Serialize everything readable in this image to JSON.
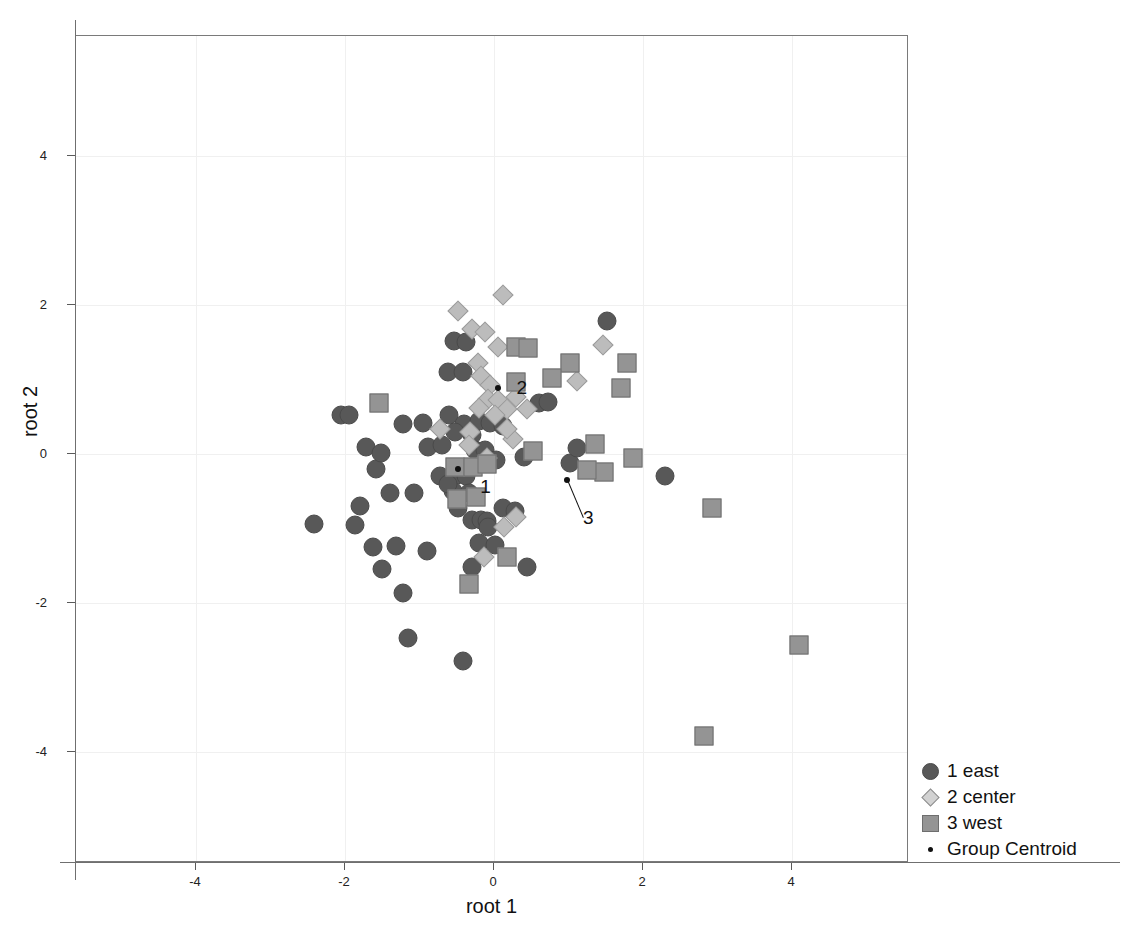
{
  "chart_data": {
    "type": "scatter",
    "title": "",
    "xlabel": "root 1",
    "ylabel": "root 2",
    "xlim": [
      -5.6,
      5.57
    ],
    "ylim": [
      -5.49,
      5.61
    ],
    "xticks": [
      -4,
      -2,
      0,
      2,
      4
    ],
    "yticks": [
      -4,
      -2,
      0,
      2,
      4
    ],
    "xticklabels": [
      "-4",
      "-2",
      "0",
      "2",
      "4"
    ],
    "yticklabels": [
      "-4",
      "-2",
      "0",
      "2",
      "4"
    ],
    "grid": true,
    "legend_position": "right-bottom-outside",
    "colors": {
      "group_1_east": "#585858",
      "group_2_center": "#bcbcbc",
      "group_3_west": "#949494",
      "centroid": "#111111",
      "gridline": "#f0f0f0",
      "frame": "#7a7a7a"
    },
    "series": [
      {
        "name": "1 east",
        "marker": "circle",
        "points": [
          [
            -2.42,
            -0.94
          ],
          [
            -2.05,
            0.53
          ],
          [
            -1.95,
            0.52
          ],
          [
            -1.72,
            0.09
          ],
          [
            -1.58,
            -0.2
          ],
          [
            -1.4,
            -0.52
          ],
          [
            -1.08,
            -0.52
          ],
          [
            -1.86,
            -0.95
          ],
          [
            -1.63,
            -1.25
          ],
          [
            -1.32,
            -1.24
          ],
          [
            -1.5,
            -1.55
          ],
          [
            -1.22,
            -1.87
          ],
          [
            -0.9,
            -1.3
          ],
          [
            -1.16,
            -2.47
          ],
          [
            -0.55,
            -0.5
          ],
          [
            -0.72,
            -0.3
          ],
          [
            -0.5,
            -0.28
          ],
          [
            -0.37,
            -0.3
          ],
          [
            -0.34,
            -0.52
          ],
          [
            -0.48,
            -0.72
          ],
          [
            -0.3,
            -0.88
          ],
          [
            -0.17,
            -0.88
          ],
          [
            -0.1,
            -0.9
          ],
          [
            -0.62,
            1.1
          ],
          [
            -0.42,
            1.1
          ],
          [
            -0.6,
            0.52
          ],
          [
            -0.4,
            0.4
          ],
          [
            -0.3,
            0.26
          ],
          [
            -0.25,
            0.05
          ],
          [
            -0.12,
            0.05
          ],
          [
            -0.06,
            -0.08
          ],
          [
            0.03,
            -0.08
          ],
          [
            -0.2,
            0.44
          ],
          [
            -0.05,
            0.42
          ],
          [
            0.12,
            0.38
          ],
          [
            -0.54,
            1.52
          ],
          [
            -0.38,
            1.5
          ],
          [
            -0.2,
            -1.2
          ],
          [
            0.02,
            -1.22
          ],
          [
            -0.3,
            -1.52
          ],
          [
            0.12,
            -0.72
          ],
          [
            0.28,
            -0.76
          ],
          [
            0.4,
            -0.04
          ],
          [
            0.6,
            0.68
          ],
          [
            0.72,
            0.7
          ],
          [
            1.02,
            -0.12
          ],
          [
            1.12,
            0.08
          ],
          [
            1.52,
            1.78
          ],
          [
            2.3,
            -0.3
          ],
          [
            0.44,
            -1.52
          ],
          [
            -0.42,
            -2.78
          ],
          [
            -0.08,
            -0.98
          ],
          [
            -0.62,
            -0.4
          ],
          [
            -1.22,
            0.4
          ],
          [
            -0.95,
            0.42
          ],
          [
            -1.52,
            0.02
          ],
          [
            -1.8,
            -0.7
          ],
          [
            -0.88,
            0.1
          ],
          [
            -0.7,
            0.12
          ],
          [
            -0.52,
            0.3
          ]
        ]
      },
      {
        "name": "2 center",
        "marker": "diamond",
        "points": [
          [
            -0.48,
            1.92
          ],
          [
            0.12,
            2.14
          ],
          [
            -0.3,
            1.68
          ],
          [
            -0.12,
            1.64
          ],
          [
            0.06,
            1.44
          ],
          [
            -0.22,
            1.22
          ],
          [
            -0.18,
            1.05
          ],
          [
            -0.05,
            0.92
          ],
          [
            -0.08,
            0.74
          ],
          [
            0.05,
            0.72
          ],
          [
            0.18,
            0.6
          ],
          [
            -0.2,
            0.62
          ],
          [
            -0.32,
            0.3
          ],
          [
            0.02,
            0.52
          ],
          [
            -0.34,
            0.12
          ],
          [
            -0.1,
            -0.06
          ],
          [
            0.26,
            0.2
          ],
          [
            0.18,
            0.34
          ],
          [
            0.3,
            -0.84
          ],
          [
            0.14,
            -0.98
          ],
          [
            -0.14,
            -1.38
          ],
          [
            1.46,
            1.46
          ],
          [
            1.12,
            0.98
          ],
          [
            -0.72,
            0.34
          ],
          [
            0.44,
            0.6
          ],
          [
            0.3,
            0.76
          ]
        ]
      },
      {
        "name": "3 west",
        "marker": "square",
        "points": [
          [
            -1.55,
            0.68
          ],
          [
            0.3,
            1.44
          ],
          [
            0.45,
            1.42
          ],
          [
            1.02,
            1.22
          ],
          [
            1.78,
            1.22
          ],
          [
            1.7,
            0.88
          ],
          [
            0.3,
            0.96
          ],
          [
            0.52,
            0.04
          ],
          [
            -0.52,
            -0.18
          ],
          [
            -0.28,
            -0.18
          ],
          [
            -0.1,
            -0.14
          ],
          [
            -0.5,
            -0.6
          ],
          [
            -0.24,
            -0.58
          ],
          [
            1.35,
            0.14
          ],
          [
            1.48,
            -0.24
          ],
          [
            1.86,
            -0.06
          ],
          [
            -0.34,
            -1.74
          ],
          [
            0.18,
            -1.38
          ],
          [
            2.92,
            -0.72
          ],
          [
            4.1,
            -2.56
          ],
          [
            2.82,
            -3.78
          ],
          [
            1.25,
            -0.22
          ],
          [
            0.78,
            1.02
          ]
        ]
      }
    ],
    "centroids": [
      {
        "label": "1",
        "x": -0.48,
        "y": -0.2,
        "label_dx": 22,
        "label_dy": 18,
        "leader": false
      },
      {
        "label": "2",
        "x": 0.06,
        "y": 0.88,
        "label_dx": 18,
        "label_dy": 0,
        "leader": false
      },
      {
        "label": "3",
        "x": 0.98,
        "y": -0.35,
        "label_dx": 16,
        "label_dy": 38,
        "leader": true
      }
    ],
    "legend": [
      {
        "symbol": "circle",
        "label": "1 east"
      },
      {
        "symbol": "diamond",
        "label": "2 center"
      },
      {
        "symbol": "square",
        "label": "3 west"
      },
      {
        "symbol": "dot",
        "label": "Group Centroid"
      }
    ]
  }
}
